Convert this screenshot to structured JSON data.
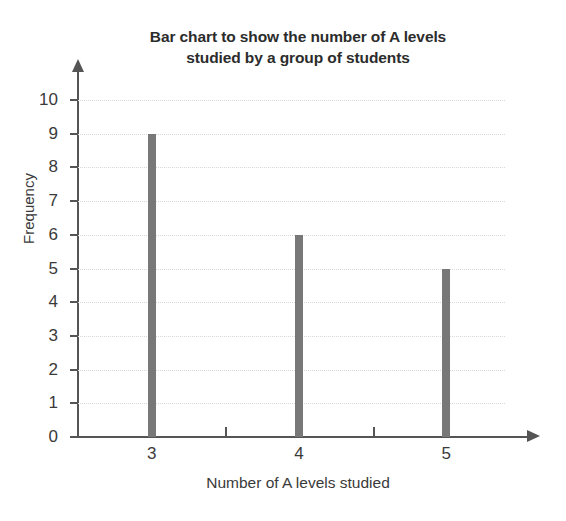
{
  "chart_data": {
    "type": "bar",
    "title": "Bar chart to show the number of A levels studied by a group of students",
    "title_lines": [
      "Bar chart to show the number of A levels",
      "studied by a group of students"
    ],
    "xlabel": "Number of A levels studied",
    "ylabel": "Frequency",
    "categories": [
      "3",
      "4",
      "5"
    ],
    "values": [
      9,
      6,
      5
    ],
    "ylim": [
      0,
      10
    ],
    "xlim": [
      2.5,
      5.5
    ],
    "y_ticks": [
      0,
      1,
      2,
      3,
      4,
      5,
      6,
      7,
      8,
      9,
      10
    ],
    "y_tick_labels": [
      "0",
      "1",
      "2",
      "3",
      "4",
      "5",
      "6",
      "7",
      "8",
      "9",
      "10"
    ],
    "x_tick_labels": [
      "3",
      "4",
      "5"
    ],
    "x_minor_ticks": [
      "3.5",
      "4.5"
    ],
    "grid": "horizontal-dotted",
    "legend": "none",
    "bar_color": "#787878",
    "axis_color": "#555555",
    "grid_color": "#d8d8d8",
    "text_color": "#3a3a3a"
  }
}
